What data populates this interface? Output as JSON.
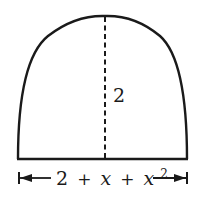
{
  "diagram": {
    "type": "parabolic-arch-region",
    "height_label": "2",
    "base_label": {
      "constant": "2",
      "plus1": "+",
      "var1": "x",
      "plus2": "+",
      "var2": "x",
      "exponent": "2"
    },
    "colors": {
      "stroke": "#1a1a1a",
      "background": "#ffffff"
    }
  }
}
